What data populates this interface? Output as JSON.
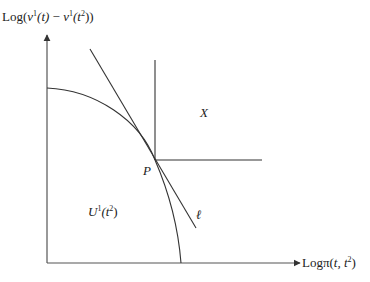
{
  "diagram": {
    "y_axis_label": {
      "prefix": "Log(",
      "v1": "v",
      "s1": "1",
      "a1": "(t)",
      "minus": " − ",
      "v2": "v",
      "s2": "1",
      "a2": "(t",
      "s3": "2",
      "suffix": "))"
    },
    "x_axis_label": {
      "prefix": "Logπ(",
      "t": "t, t",
      "s": "2",
      "suffix": ")"
    },
    "region_U": {
      "U": "U",
      "sup1": "1",
      "paren": "(t",
      "sup2": "2",
      "close": ")"
    },
    "region_X": "X",
    "point_P": "P",
    "line_l": "ℓ",
    "colors": {
      "lines": "#333333",
      "axes": "#555555"
    }
  }
}
